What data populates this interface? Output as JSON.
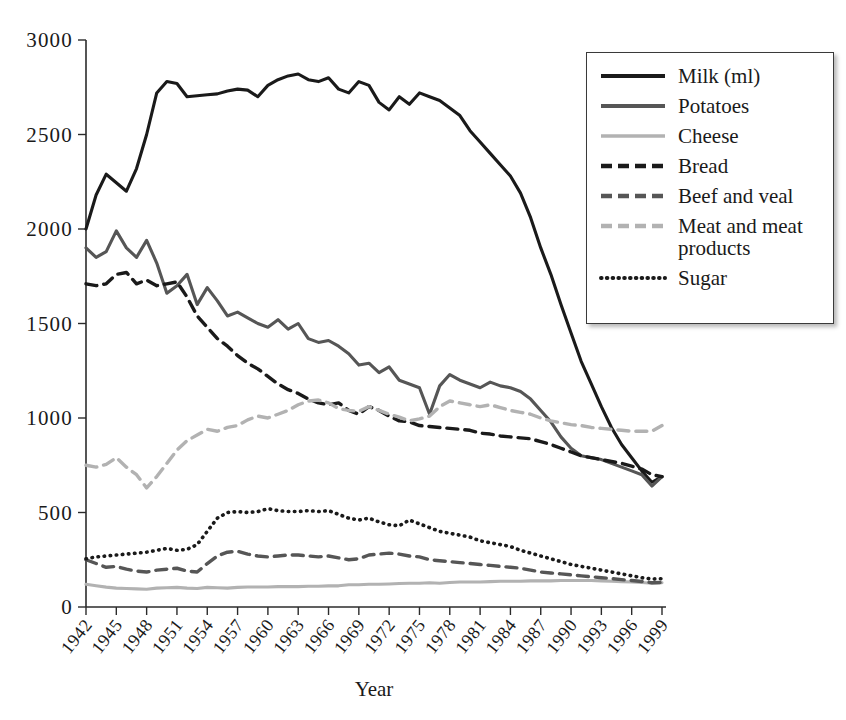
{
  "chart_data": {
    "type": "line",
    "title": "",
    "xlabel": "Year",
    "ylabel": "",
    "xlim": [
      1942,
      1999
    ],
    "ylim": [
      0,
      3000
    ],
    "grid": false,
    "legend_position": "top-right",
    "x_tick_labels": [
      "1942",
      "1945",
      "1948",
      "1951",
      "1954",
      "1957",
      "1960",
      "1963",
      "1966",
      "1969",
      "1972",
      "1975",
      "1978",
      "1981",
      "1984",
      "1987",
      "1990",
      "1993",
      "1996",
      "1999"
    ],
    "y_tick_labels": [
      "0",
      "500",
      "1000",
      "1500",
      "2000",
      "2500",
      "3000"
    ],
    "y_ticks": [
      0,
      500,
      1000,
      1500,
      2000,
      2500,
      3000
    ],
    "x": [
      1942,
      1943,
      1944,
      1945,
      1946,
      1947,
      1948,
      1949,
      1950,
      1951,
      1952,
      1953,
      1954,
      1955,
      1956,
      1957,
      1958,
      1959,
      1960,
      1961,
      1962,
      1963,
      1964,
      1965,
      1966,
      1967,
      1968,
      1969,
      1970,
      1971,
      1972,
      1973,
      1974,
      1975,
      1976,
      1977,
      1978,
      1979,
      1980,
      1981,
      1982,
      1983,
      1984,
      1985,
      1986,
      1987,
      1988,
      1989,
      1990,
      1991,
      1992,
      1993,
      1994,
      1995,
      1996,
      1997,
      1998,
      1999
    ],
    "series": [
      {
        "name": "Milk (ml)",
        "color": "#1a1a1a",
        "style": "solid",
        "width": 3.1,
        "values": [
          2000,
          2180,
          2290,
          2245,
          2200,
          2320,
          2500,
          2720,
          2780,
          2770,
          2700,
          2705,
          2710,
          2715,
          2730,
          2740,
          2735,
          2700,
          2760,
          2790,
          2810,
          2820,
          2790,
          2780,
          2800,
          2740,
          2720,
          2780,
          2760,
          2670,
          2630,
          2700,
          2660,
          2720,
          2700,
          2680,
          2640,
          2600,
          2520,
          2460,
          2400,
          2340,
          2280,
          2190,
          2060,
          1900,
          1760,
          1600,
          1450,
          1300,
          1180,
          1060,
          950,
          860,
          790,
          720,
          660,
          690
        ]
      },
      {
        "name": "Potatoes",
        "color": "#565656",
        "style": "solid",
        "width": 3.1,
        "values": [
          1900,
          1850,
          1880,
          1990,
          1900,
          1850,
          1940,
          1820,
          1660,
          1700,
          1760,
          1600,
          1690,
          1620,
          1540,
          1560,
          1530,
          1500,
          1480,
          1520,
          1470,
          1500,
          1420,
          1400,
          1410,
          1380,
          1340,
          1280,
          1290,
          1240,
          1270,
          1200,
          1180,
          1160,
          1020,
          1170,
          1230,
          1200,
          1180,
          1160,
          1190,
          1170,
          1160,
          1140,
          1100,
          1040,
          980,
          900,
          840,
          800,
          790,
          780,
          760,
          740,
          720,
          700,
          640,
          690
        ]
      },
      {
        "name": "Cheese",
        "color": "#b2b2b2",
        "style": "solid",
        "width": 3.1,
        "values": [
          120,
          112,
          105,
          100,
          98,
          96,
          94,
          100,
          102,
          104,
          100,
          98,
          104,
          102,
          100,
          104,
          106,
          106,
          106,
          108,
          108,
          108,
          110,
          110,
          112,
          112,
          118,
          118,
          120,
          120,
          122,
          124,
          126,
          126,
          128,
          126,
          130,
          132,
          132,
          132,
          134,
          136,
          136,
          136,
          138,
          138,
          138,
          140,
          140,
          140,
          140,
          138,
          136,
          134,
          132,
          130,
          126,
          128
        ]
      },
      {
        "name": "Bread",
        "color": "#1a1a1a",
        "style": "dashed",
        "width": 3.4,
        "values": [
          1710,
          1700,
          1710,
          1760,
          1770,
          1710,
          1730,
          1700,
          1710,
          1720,
          1640,
          1540,
          1480,
          1420,
          1380,
          1330,
          1290,
          1260,
          1220,
          1180,
          1150,
          1130,
          1100,
          1080,
          1070,
          1080,
          1040,
          1020,
          1060,
          1040,
          1010,
          985,
          980,
          960,
          955,
          950,
          945,
          940,
          935,
          920,
          915,
          905,
          900,
          895,
          890,
          875,
          860,
          840,
          820,
          800,
          790,
          780,
          770,
          760,
          745,
          730,
          700,
          690
        ]
      },
      {
        "name": "Beef and veal",
        "color": "#565656",
        "style": "dashed",
        "width": 3.4,
        "values": [
          250,
          230,
          210,
          215,
          200,
          190,
          185,
          195,
          200,
          205,
          190,
          185,
          230,
          270,
          290,
          295,
          280,
          270,
          265,
          270,
          275,
          275,
          270,
          265,
          270,
          260,
          250,
          255,
          275,
          280,
          285,
          280,
          270,
          265,
          250,
          245,
          240,
          235,
          230,
          225,
          220,
          215,
          210,
          205,
          195,
          185,
          180,
          175,
          170,
          165,
          160,
          155,
          150,
          145,
          140,
          135,
          128,
          130
        ]
      },
      {
        "name": "Meat and meat\nproducts",
        "color": "#b2b2b2",
        "style": "dashed",
        "width": 3.4,
        "values": [
          750,
          740,
          755,
          790,
          740,
          700,
          630,
          690,
          760,
          830,
          880,
          910,
          940,
          930,
          950,
          960,
          990,
          1010,
          1000,
          1020,
          1040,
          1070,
          1090,
          1095,
          1080,
          1050,
          1040,
          1035,
          1060,
          1040,
          1020,
          1005,
          985,
          995,
          1010,
          1060,
          1090,
          1080,
          1070,
          1060,
          1070,
          1055,
          1040,
          1030,
          1020,
          1000,
          985,
          975,
          965,
          960,
          950,
          945,
          940,
          935,
          930,
          930,
          930,
          960
        ]
      },
      {
        "name": "Sugar",
        "color": "#1a1a1a",
        "style": "dotted",
        "width": 3.6,
        "values": [
          255,
          265,
          270,
          275,
          280,
          285,
          290,
          300,
          310,
          300,
          305,
          330,
          400,
          470,
          500,
          505,
          500,
          505,
          520,
          510,
          505,
          505,
          510,
          505,
          510,
          490,
          470,
          460,
          470,
          450,
          435,
          430,
          460,
          440,
          420,
          400,
          390,
          380,
          370,
          350,
          340,
          330,
          320,
          300,
          285,
          270,
          255,
          240,
          225,
          215,
          205,
          195,
          185,
          175,
          165,
          155,
          148,
          150
        ]
      }
    ]
  },
  "axis": {
    "x_title": "Year"
  },
  "legend": {
    "items": [
      {
        "label": "Milk (ml)"
      },
      {
        "label": "Potatoes"
      },
      {
        "label": "Cheese"
      },
      {
        "label": "Bread"
      },
      {
        "label": "Beef and veal"
      },
      {
        "label": "Meat and meat\nproducts"
      },
      {
        "label": "Sugar"
      }
    ]
  }
}
